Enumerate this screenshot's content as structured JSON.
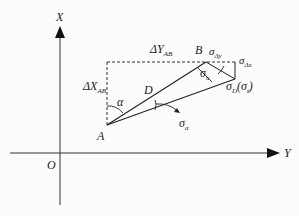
{
  "diagram": {
    "axes": {
      "x_label": "X",
      "y_label": "Y",
      "origin": "O"
    },
    "points": {
      "A": "A",
      "B": "B",
      "D": "D"
    },
    "labels": {
      "delta_y": "ΔY",
      "delta_y_sub": "AB",
      "delta_x": "ΔX",
      "delta_x_sub": "AB",
      "alpha": "α",
      "sigma": "σ",
      "sigma_alpha_sub": "α",
      "sigma_u_sub": "u",
      "sigma_dy_sub": "Δy",
      "sigma_dx_sub": "Δx",
      "sigma_D_sub": "D",
      "sigma_t_paren_open": "(σ",
      "sigma_t_sub": "t",
      "sigma_t_paren_close": ")"
    },
    "colors": {
      "line": "#222222",
      "background": "#fcfcfc"
    }
  }
}
